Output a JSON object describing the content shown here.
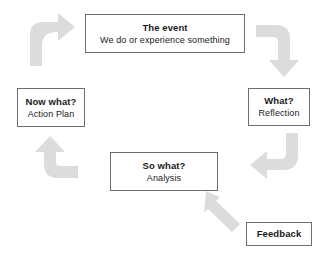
{
  "diagram": {
    "type": "cycle-flow-diagram",
    "name": "Reflective practice cycle",
    "accent_color": "#dcdcdc",
    "box_border_color": "#6e6e6e",
    "text_color": "#1a1a1a",
    "background_color": "#ffffff"
  },
  "nodes": [
    {
      "id": "event",
      "title": "The event",
      "subtitle": "We do or experience something"
    },
    {
      "id": "what",
      "title": "What?",
      "subtitle": "Reflection"
    },
    {
      "id": "sowhat",
      "title": "So what?",
      "subtitle": "Analysis"
    },
    {
      "id": "nowwhat",
      "title": "Now what?",
      "subtitle": "Action Plan"
    },
    {
      "id": "feedback",
      "title": "Feedback",
      "subtitle": ""
    }
  ],
  "arrows": [
    {
      "id": "arrow-nowwhat-to-event",
      "from": "Now what?",
      "to": "The event",
      "shape": "curved-up-right",
      "position": "top-left"
    },
    {
      "id": "arrow-event-to-what",
      "from": "The event",
      "to": "What?",
      "shape": "curved-right-down",
      "position": "top-right"
    },
    {
      "id": "arrow-what-to-sowhat",
      "from": "What?",
      "to": "So what?",
      "shape": "curved-down-left",
      "position": "right"
    },
    {
      "id": "arrow-feedback-to-sowhat",
      "from": "Feedback",
      "to": "So what?",
      "shape": "straight-diagonal-up-left",
      "position": "bottom-right"
    },
    {
      "id": "arrow-sowhat-to-nowwhat",
      "from": "So what?",
      "to": "Now what?",
      "shape": "curved-left-up",
      "position": "left"
    }
  ]
}
